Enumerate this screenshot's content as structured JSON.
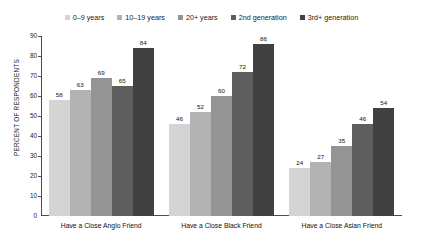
{
  "chart_data": {
    "type": "bar",
    "title": "",
    "subtitle": "",
    "xlabel": "",
    "ylabel": "PERCENT OF RESPONDENTS",
    "ylim": [
      0,
      90
    ],
    "y_ticks": [
      0,
      10,
      20,
      30,
      40,
      50,
      60,
      70,
      80,
      90
    ],
    "grid": false,
    "legend_position": "top-center",
    "categories": [
      "Have a Close Anglo Friend",
      "Have a Close Black Friend",
      "Have a Close Asian Friend"
    ],
    "series": [
      {
        "name": "0–9 years",
        "color": "#d4d4d4",
        "values": [
          58,
          46,
          24
        ]
      },
      {
        "name": "10–19 years",
        "color": "#b3b3b3",
        "values": [
          63,
          52,
          27
        ]
      },
      {
        "name": "20+ years",
        "color": "#949494",
        "values": [
          69,
          60,
          35
        ]
      },
      {
        "name": "2nd generation",
        "color": "#5e5e5e",
        "values": [
          65,
          72,
          46
        ]
      },
      {
        "name": "3rd+ generation",
        "color": "#414141",
        "values": [
          84,
          86,
          54
        ]
      }
    ]
  },
  "axis": {
    "y_title": "PERCENT OF RESPONDENTS",
    "y_tick_labels": [
      "90",
      "80",
      "70",
      "60",
      "50",
      "40",
      "30",
      "20",
      "10",
      "0"
    ]
  },
  "legend": {
    "items": [
      {
        "label": "0–9 years"
      },
      {
        "label": "10–19 years"
      },
      {
        "label": "20+ years"
      },
      {
        "label": "2nd generation"
      },
      {
        "label": "3rd+ generation"
      }
    ]
  },
  "bar_labels": {
    "g0": [
      "58",
      "63",
      "69",
      "65",
      "84"
    ],
    "g1": [
      "46",
      "52",
      "60",
      "72",
      "86"
    ],
    "g2": [
      "24",
      "27",
      "35",
      "46",
      "54"
    ]
  },
  "categories": [
    {
      "label": "Have a Close Anglo Friend"
    },
    {
      "label": "Have a Close Black Friend"
    },
    {
      "label": "Have a Close Asian Friend"
    }
  ]
}
